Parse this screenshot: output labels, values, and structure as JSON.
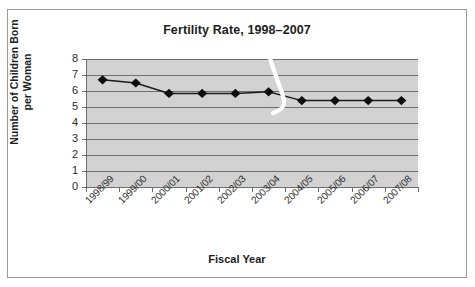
{
  "chart_data": {
    "type": "line",
    "title": "Fertility Rate, 1998–2007",
    "xlabel": "Fiscal Year",
    "ylabel": "Number of Children Born per Woman",
    "ylabel_line1": "Number of Children Born",
    "ylabel_line2": "per Woman",
    "categories": [
      "1998/99",
      "1999/00",
      "2000/01",
      "2001/02",
      "2002/03",
      "2003/04",
      "2004/05",
      "2005/06",
      "2006/07",
      "2007/08"
    ],
    "values": [
      6.7,
      6.5,
      5.85,
      5.85,
      5.85,
      5.95,
      5.4,
      5.4,
      5.4,
      5.4
    ],
    "series": [
      {
        "name": "Fertility Rate",
        "values": [
          6.7,
          6.5,
          5.85,
          5.85,
          5.85,
          5.95,
          5.4,
          5.4,
          5.4,
          5.4
        ]
      }
    ],
    "ylim": [
      0,
      8
    ],
    "yticks": [
      8,
      7,
      6,
      5,
      4,
      3,
      2,
      1,
      0
    ],
    "ytick_labels": [
      "8",
      "7",
      "6",
      "5",
      "4",
      "3",
      "2",
      "1",
      "0"
    ],
    "grid": true,
    "legend": "none",
    "marker": "diamond",
    "colors": {
      "line": "#1a1a1a",
      "marker": "#0d0d0d",
      "plot_background": "#d2d2d2",
      "gridline": "#6f6f6f",
      "axis": "#6e6e6e",
      "frame": "#9a9a9a",
      "text": "#1d1d1d",
      "artifact": "#ffffff"
    },
    "annotations": [
      {
        "name": "scan-artifact-streak",
        "description": "white curved scanning streak over plot near 2003/04"
      }
    ]
  }
}
